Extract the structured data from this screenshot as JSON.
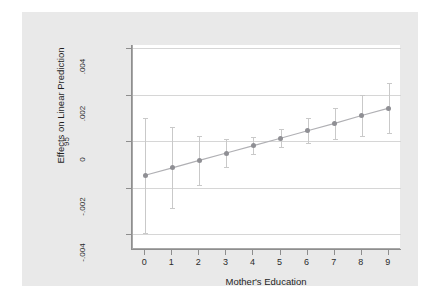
{
  "chart_data": {
    "type": "line",
    "title": "",
    "subtitle": "",
    "xlabel": "Mother's Education",
    "ylabel": "Effects on Linear Prediction",
    "level_label": "95",
    "x": [
      0,
      1,
      2,
      3,
      4,
      5,
      6,
      7,
      8,
      9
    ],
    "xticklabels": [
      "0",
      "1",
      "2",
      "3",
      "4",
      "5",
      "6",
      "7",
      "8",
      "9"
    ],
    "yticklabels": [
      ".004",
      ".002",
      "0",
      "-.002",
      "-.004"
    ],
    "ytickvalues": [
      0.004,
      0.002,
      0,
      -0.002,
      -0.004
    ],
    "xlim": [
      -0.45,
      9.45
    ],
    "ylim": [
      -0.00465,
      0.00415
    ],
    "grid": true,
    "legend": "none",
    "series": [
      {
        "name": "Effects on Linear Prediction",
        "values": [
          -0.00147,
          -0.00115,
          -0.00083,
          -0.00051,
          -0.00019,
          0.00013,
          0.00045,
          0.00077,
          0.00111,
          0.00143
        ],
        "ci_low": [
          -0.00395,
          -0.0029,
          -0.0019,
          -0.00112,
          -0.00057,
          -0.00027,
          -8e-05,
          0.0001,
          0.00022,
          0.00036
        ],
        "ci_high": [
          0.00101,
          0.0006,
          0.00024,
          0.0001,
          0.00019,
          0.00053,
          0.00098,
          0.00144,
          0.002,
          0.0025
        ]
      }
    ],
    "marker_color": "#8f8f94",
    "line_color": "#b0b0b4",
    "errorbar_color": "#c9c9c9",
    "grid_color": "#d6d6d6",
    "plot_background": "#ffffff",
    "card_background": "#e9e9e9"
  }
}
